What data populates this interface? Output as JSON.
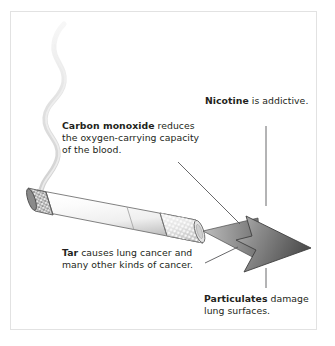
{
  "figure": {
    "name": "cigarette-harmful-components-diagram",
    "background_color": "#ffffff",
    "border_color": "#e2e2e2",
    "text_color": "#231f20"
  },
  "labels": {
    "nicotine": {
      "bold": "Nicotine",
      "rest": " is addictive.",
      "lines": [
        "Nicotine is addictive."
      ]
    },
    "carbon_monoxide": {
      "bold": "Carbon monoxide",
      "rest": " reduces",
      "line1_rest": " reduces",
      "line2": "the oxygen-carrying capacity",
      "line3": "of the blood."
    },
    "tar": {
      "bold": "Tar",
      "rest": " causes lung cancer and",
      "line2": "many other kinds of cancer."
    },
    "particulates": {
      "bold": "Particulates",
      "rest": " damage",
      "line2": "lung surfaces."
    }
  },
  "graphic": {
    "smoke": {
      "name": "smoke-trail",
      "color": "#dedede"
    },
    "cigarette": {
      "name": "cigarette",
      "paper_color": "#f4f4f4",
      "paper_shadow": "#c9c9c9",
      "outline_color": "#6b6b6b",
      "ash_color": "#7c7c7c",
      "filter_color": "#d8d8d8",
      "filter_dot_color": "#ffffff"
    },
    "arrow": {
      "name": "smoke-stream-arrow",
      "fill_light": "#9a9a9a",
      "fill_dark": "#4d4d4d",
      "outline_color": "#3f3f3f"
    },
    "leaders": {
      "name": "leader-lines",
      "color": "#58585a",
      "items": [
        "nicotine-vertical-leader",
        "carbon-monoxide-diagonal-leader",
        "tar-diagonal-leader",
        "particulates-vertical-leader"
      ]
    }
  }
}
